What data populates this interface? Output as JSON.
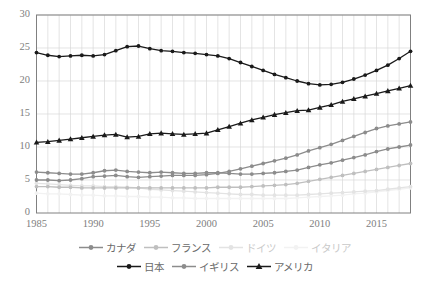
{
  "chart_data": {
    "type": "line",
    "title": "",
    "xlabel": "",
    "ylabel": "",
    "xlim": [
      1985,
      2018
    ],
    "ylim": [
      0,
      30
    ],
    "grid": true,
    "legend_position": "bottom",
    "xticks": [
      "1985",
      "1990",
      "1995",
      "2000",
      "2005",
      "2010",
      "2015"
    ],
    "yticks": [
      "0",
      "5",
      "10",
      "15",
      "20",
      "25",
      "30"
    ],
    "x": [
      1985,
      1986,
      1987,
      1988,
      1989,
      1990,
      1991,
      1992,
      1993,
      1994,
      1995,
      1996,
      1997,
      1998,
      1999,
      2000,
      2001,
      2002,
      2003,
      2004,
      2005,
      2006,
      2007,
      2008,
      2009,
      2010,
      2011,
      2012,
      2013,
      2014,
      2015,
      2016,
      2017,
      2018
    ],
    "series": [
      {
        "name": "カナダ",
        "color": "#8c8c8c",
        "marker": "circle",
        "values": [
          6.2,
          6.1,
          6.0,
          5.9,
          5.9,
          6.1,
          6.4,
          6.5,
          6.3,
          6.2,
          6.1,
          6.2,
          6.1,
          6.0,
          6.0,
          6.1,
          6.1,
          6.0,
          5.9,
          5.9,
          6.0,
          6.1,
          6.3,
          6.5,
          6.9,
          7.3,
          7.6,
          8.0,
          8.4,
          8.8,
          9.3,
          9.7,
          10.0,
          10.3
        ]
      },
      {
        "name": "フランス",
        "color": "#bfbfbf",
        "marker": "circle",
        "values": [
          4.0,
          4.0,
          3.9,
          3.9,
          3.8,
          3.8,
          3.8,
          3.8,
          3.8,
          3.8,
          3.8,
          3.8,
          3.8,
          3.8,
          3.8,
          3.8,
          3.9,
          3.9,
          3.9,
          4.0,
          4.1,
          4.2,
          4.3,
          4.5,
          4.8,
          5.1,
          5.4,
          5.7,
          6.0,
          6.3,
          6.6,
          6.9,
          7.2,
          7.5
        ]
      },
      {
        "name": "ドイツ",
        "color": "#e3e3e3",
        "marker": "circle",
        "values": [
          4.5,
          4.4,
          4.3,
          4.2,
          4.1,
          4.1,
          4.0,
          4.0,
          3.9,
          3.8,
          3.6,
          3.5,
          3.4,
          3.3,
          3.2,
          3.1,
          3.0,
          2.9,
          2.8,
          2.8,
          2.7,
          2.7,
          2.7,
          2.7,
          2.8,
          2.9,
          3.0,
          3.1,
          3.2,
          3.3,
          3.4,
          3.6,
          3.8,
          4.0
        ]
      },
      {
        "name": "イタリア",
        "color": "#f2f2f2",
        "marker": "circle",
        "values": [
          3.0,
          2.9,
          2.9,
          2.8,
          2.7,
          2.7,
          2.6,
          2.6,
          2.5,
          2.5,
          2.4,
          2.4,
          2.3,
          2.3,
          2.2,
          2.2,
          2.2,
          2.2,
          2.2,
          2.2,
          2.2,
          2.2,
          2.2,
          2.3,
          2.4,
          2.5,
          2.6,
          2.7,
          2.9,
          3.0,
          3.2,
          3.4,
          3.6,
          3.8
        ]
      },
      {
        "name": "日本",
        "color": "#1a1a1a",
        "marker": "circle",
        "values": [
          24.3,
          23.9,
          23.7,
          23.8,
          23.9,
          23.8,
          24.0,
          24.6,
          25.2,
          25.3,
          24.9,
          24.6,
          24.5,
          24.3,
          24.2,
          24.0,
          23.8,
          23.4,
          22.8,
          22.2,
          21.6,
          21.0,
          20.5,
          20.0,
          19.6,
          19.4,
          19.5,
          19.8,
          20.3,
          20.9,
          21.6,
          22.4,
          23.4,
          24.5
        ]
      },
      {
        "name": "イギリス",
        "color": "#8c8c8c",
        "marker": "circle",
        "values": [
          5.0,
          5.0,
          4.9,
          5.0,
          5.2,
          5.5,
          5.6,
          5.7,
          5.5,
          5.4,
          5.5,
          5.6,
          5.7,
          5.7,
          5.7,
          5.8,
          6.0,
          6.3,
          6.7,
          7.1,
          7.5,
          7.9,
          8.3,
          8.8,
          9.4,
          9.9,
          10.4,
          11.0,
          11.6,
          12.2,
          12.8,
          13.2,
          13.5,
          13.8
        ]
      },
      {
        "name": "アメリカ",
        "color": "#1a1a1a",
        "marker": "triangle",
        "values": [
          10.7,
          10.8,
          11.0,
          11.2,
          11.4,
          11.6,
          11.8,
          11.9,
          11.5,
          11.6,
          12.0,
          12.1,
          12.0,
          11.9,
          12.0,
          12.1,
          12.6,
          13.1,
          13.6,
          14.1,
          14.5,
          14.9,
          15.2,
          15.5,
          15.6,
          16.0,
          16.4,
          16.9,
          17.3,
          17.7,
          18.1,
          18.5,
          18.9,
          19.3
        ]
      }
    ]
  },
  "legend": {
    "row1": [
      {
        "label": "カナダ",
        "color": "#8c8c8c",
        "marker": "circle",
        "faint": false
      },
      {
        "label": "フランス",
        "color": "#bfbfbf",
        "marker": "circle",
        "faint": false
      },
      {
        "label": "ドイツ",
        "color": "#e3e3e3",
        "marker": "circle",
        "faint": true
      },
      {
        "label": "イタリア",
        "color": "#f2f2f2",
        "marker": "circle",
        "faint": true
      }
    ],
    "row2": [
      {
        "label": "日本",
        "color": "#1a1a1a",
        "marker": "circle",
        "faint": false
      },
      {
        "label": "イギリス",
        "color": "#8c8c8c",
        "marker": "circle",
        "faint": false
      },
      {
        "label": "アメリカ",
        "color": "#1a1a1a",
        "marker": "triangle",
        "faint": false
      }
    ]
  },
  "axes": {
    "frame_color": "#808080",
    "grid_color": "#d9d9d9"
  }
}
